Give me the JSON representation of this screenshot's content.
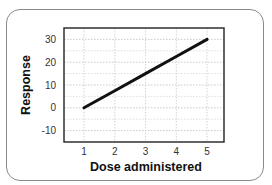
{
  "chart_data": {
    "type": "line",
    "title": "",
    "xlabel": "Dose administered",
    "ylabel": "Response",
    "x": [
      1,
      2,
      3,
      4,
      5
    ],
    "series": [
      {
        "name": "Response",
        "values": [
          0,
          7.5,
          15,
          22.5,
          30
        ],
        "color": "#111111"
      }
    ],
    "x_ticks": [
      "1",
      "2",
      "3",
      "4",
      "5"
    ],
    "y_ticks": [
      "30",
      "20",
      "10",
      "0",
      "-10"
    ],
    "xlim": [
      0.35,
      5.55
    ],
    "ylim": [
      -15,
      35
    ],
    "grid": true,
    "legend": null
  },
  "labels": {
    "xlabel": "Dose administered",
    "ylabel": "Response",
    "x_ticks": [
      "1",
      "2",
      "3",
      "4",
      "5"
    ],
    "y_ticks": [
      "30",
      "20",
      "10",
      "0",
      "-10"
    ]
  }
}
